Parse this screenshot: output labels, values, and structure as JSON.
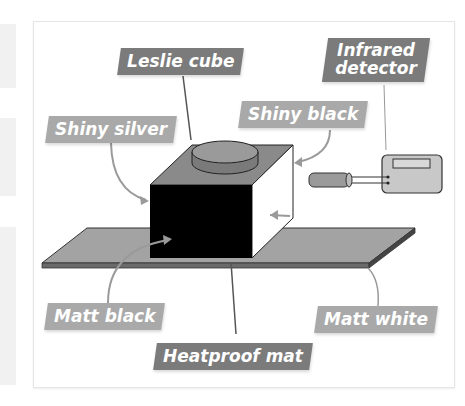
{
  "diagram": {
    "labels": {
      "leslie_cube": "Leslie cube",
      "infrared_detector_line1": "Infrared",
      "infrared_detector_line2": "detector",
      "shiny_silver": "Shiny silver",
      "shiny_black": "Shiny black",
      "matt_black": "Matt black",
      "matt_white": "Matt white",
      "heatproof_mat": "Heatproof mat"
    },
    "colors": {
      "label_dark": "#7b7b7b",
      "label_light": "#a9a9a9",
      "mat": "#a3a3a3",
      "cube_front": "#000000",
      "cube_top": "#8a8a8a",
      "cube_side": "#ffffff",
      "detector_body": "#c8c8c8"
    }
  }
}
